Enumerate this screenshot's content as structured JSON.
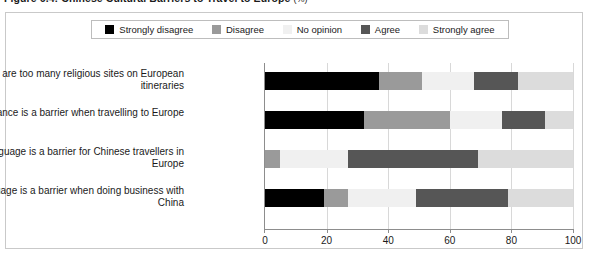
{
  "figure": {
    "title": "Figure 6.4: Chinese Cultural Barriers to Travel to Europe",
    "title_unit": "(%)"
  },
  "legend": {
    "items": [
      {
        "label": "Strongly disagree",
        "color": "#000000",
        "name": "strongly-disagree"
      },
      {
        "label": "Disagree",
        "color": "#9a9a9a",
        "name": "disagree"
      },
      {
        "label": "No opinion",
        "color": "#f0f0f0",
        "name": "no-opinion"
      },
      {
        "label": "Agree",
        "color": "#565656",
        "name": "agree"
      },
      {
        "label": "Strongly agree",
        "color": "#dcdcdc",
        "name": "strongly-agree"
      }
    ]
  },
  "axis": {
    "ticks": [
      "0",
      "20",
      "40",
      "60",
      "80",
      "100"
    ],
    "min": 0,
    "max": 100
  },
  "chart_data": {
    "type": "bar",
    "orientation": "horizontal",
    "stacked": true,
    "title": "Figure 6.4: Chinese Cultural Barriers to Travel to Europe (%)",
    "xlabel": "",
    "ylabel": "",
    "xlim": [
      0,
      100
    ],
    "grid": true,
    "legend_position": "top",
    "categories": [
      "There are too many religious sites on European itineraries",
      "Distance is a barrier when travelling to Europe",
      "Language is a barrier for Chinese travellers in Europe",
      "Language is a barrier when doing business with China"
    ],
    "series": [
      {
        "name": "Strongly disagree",
        "color": "#000000",
        "values": [
          37,
          32,
          0,
          19
        ]
      },
      {
        "name": "Disagree",
        "color": "#9a9a9a",
        "values": [
          14,
          28,
          5,
          8
        ]
      },
      {
        "name": "No opinion",
        "color": "#f0f0f0",
        "values": [
          17,
          17,
          22,
          22
        ]
      },
      {
        "name": "Agree",
        "color": "#565656",
        "values": [
          14,
          14,
          42,
          30
        ]
      },
      {
        "name": "Strongly agree",
        "color": "#dcdcdc",
        "values": [
          18,
          9,
          31,
          21
        ]
      }
    ]
  }
}
